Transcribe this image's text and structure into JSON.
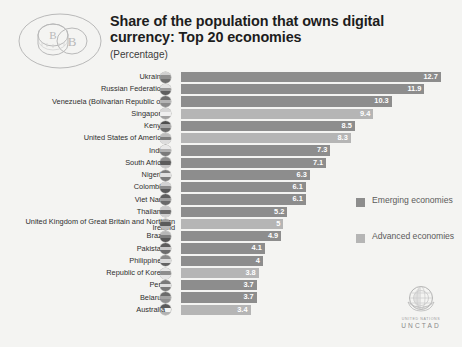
{
  "header": {
    "title": "Share of the population that owns digital currency: Top 20 economies",
    "subtitle": "(Percentage)",
    "icon": "digital-coin-icon"
  },
  "legend": {
    "position": "right",
    "items": [
      {
        "label": "Emerging economies",
        "color": "#8d8d8d",
        "key": "emerging"
      },
      {
        "label": "Advanced economies",
        "color": "#b5b5b5",
        "key": "advanced"
      }
    ]
  },
  "branding": {
    "organization": "UNITED NATIONS",
    "name": "UNCTAD",
    "logo": "un-emblem-icon"
  },
  "chart_data": {
    "type": "bar",
    "orientation": "horizontal",
    "title": "Share of the population that owns digital currency: Top 20 economies",
    "subtitle": "(Percentage)",
    "xlabel": "",
    "ylabel": "",
    "xlim": [
      0,
      13.2
    ],
    "grid": false,
    "legend_position": "right",
    "value_labels": true,
    "categories": [
      "Ukraine",
      "Russian Federation",
      "Venezuela (Bolivarian Republic of)",
      "Singapore",
      "Kenya",
      "United States of America",
      "India",
      "South Africa",
      "Nigeria",
      "Colombia",
      "Viet Nam",
      "Thailand",
      "United Kingdom of Great Britain and Northern Ireland",
      "Brazil",
      "Pakistan",
      "Philippines",
      "Republic of Korea",
      "Peru",
      "Belarus",
      "Australia"
    ],
    "values": [
      12.7,
      11.9,
      10.3,
      9.4,
      8.5,
      8.3,
      7.3,
      7.1,
      6.3,
      6.1,
      6.1,
      5.2,
      5.0,
      4.9,
      4.1,
      4.0,
      3.8,
      3.7,
      3.7,
      3.4
    ],
    "groups": [
      "emerging",
      "emerging",
      "emerging",
      "advanced",
      "emerging",
      "advanced",
      "emerging",
      "emerging",
      "emerging",
      "emerging",
      "emerging",
      "emerging",
      "advanced",
      "emerging",
      "emerging",
      "emerging",
      "advanced",
      "emerging",
      "emerging",
      "advanced"
    ],
    "series": [
      {
        "name": "Emerging economies",
        "color": "#8d8d8d",
        "values": [
          12.7,
          11.9,
          10.3,
          null,
          8.5,
          null,
          7.3,
          7.1,
          6.3,
          6.1,
          6.1,
          5.2,
          null,
          4.9,
          4.1,
          4.0,
          null,
          3.7,
          3.7,
          null
        ]
      },
      {
        "name": "Advanced economies",
        "color": "#b5b5b5",
        "values": [
          null,
          null,
          null,
          9.4,
          null,
          8.3,
          null,
          null,
          null,
          null,
          null,
          null,
          5.0,
          null,
          null,
          null,
          3.8,
          null,
          null,
          3.4
        ]
      }
    ],
    "rows": [
      {
        "label": "Ukraine",
        "value": 12.7,
        "group": "emerging",
        "flag": "flag-ukraine"
      },
      {
        "label": "Russian Federation",
        "value": 11.9,
        "group": "emerging",
        "flag": "flag-russian-federation"
      },
      {
        "label": "Venezuela (Bolivarian Republic of)",
        "value": 10.3,
        "group": "emerging",
        "flag": "flag-venezuela"
      },
      {
        "label": "Singapore",
        "value": 9.4,
        "group": "advanced",
        "flag": "flag-singapore"
      },
      {
        "label": "Kenya",
        "value": 8.5,
        "group": "emerging",
        "flag": "flag-kenya"
      },
      {
        "label": "United States of America",
        "value": 8.3,
        "group": "advanced",
        "flag": "flag-united-states"
      },
      {
        "label": "India",
        "value": 7.3,
        "group": "emerging",
        "flag": "flag-india"
      },
      {
        "label": "South Africa",
        "value": 7.1,
        "group": "emerging",
        "flag": "flag-south-africa"
      },
      {
        "label": "Nigeria",
        "value": 6.3,
        "group": "emerging",
        "flag": "flag-nigeria"
      },
      {
        "label": "Colombia",
        "value": 6.1,
        "group": "emerging",
        "flag": "flag-colombia"
      },
      {
        "label": "Viet Nam",
        "value": 6.1,
        "group": "emerging",
        "flag": "flag-viet-nam"
      },
      {
        "label": "Thailand",
        "value": 5.2,
        "group": "emerging",
        "flag": "flag-thailand"
      },
      {
        "label": "United Kingdom of Great Britain and Northern Ireland",
        "value": 5.0,
        "group": "advanced",
        "flag": "flag-united-kingdom"
      },
      {
        "label": "Brazil",
        "value": 4.9,
        "group": "emerging",
        "flag": "flag-brazil"
      },
      {
        "label": "Pakistan",
        "value": 4.1,
        "group": "emerging",
        "flag": "flag-pakistan"
      },
      {
        "label": "Philippines",
        "value": 4.0,
        "group": "emerging",
        "flag": "flag-philippines"
      },
      {
        "label": "Republic of Korea",
        "value": 3.8,
        "group": "advanced",
        "flag": "flag-republic-of-korea"
      },
      {
        "label": "Peru",
        "value": 3.7,
        "group": "emerging",
        "flag": "flag-peru"
      },
      {
        "label": "Belarus",
        "value": 3.7,
        "group": "emerging",
        "flag": "flag-belarus"
      },
      {
        "label": "Australia",
        "value": 3.4,
        "group": "advanced",
        "flag": "flag-australia"
      }
    ]
  }
}
